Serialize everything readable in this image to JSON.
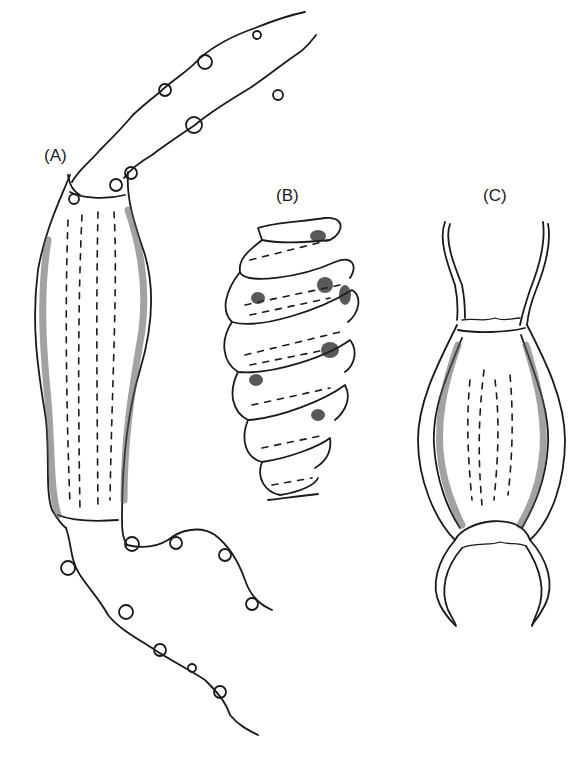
{
  "figure": {
    "colors": {
      "ink": "#1a1a1a",
      "background": "#ffffff",
      "shading": "#555555"
    },
    "panels": [
      {
        "id": "A",
        "label": "(A)",
        "subject": "elongated egg case with long coiled tendrils at both ends"
      },
      {
        "id": "B",
        "label": "(B)",
        "subject": "spiral (screw-shaped) egg case with helical flanges"
      },
      {
        "id": "C",
        "label": "(C)",
        "subject": "rectangular egg case with four horn-like extensions"
      }
    ]
  }
}
